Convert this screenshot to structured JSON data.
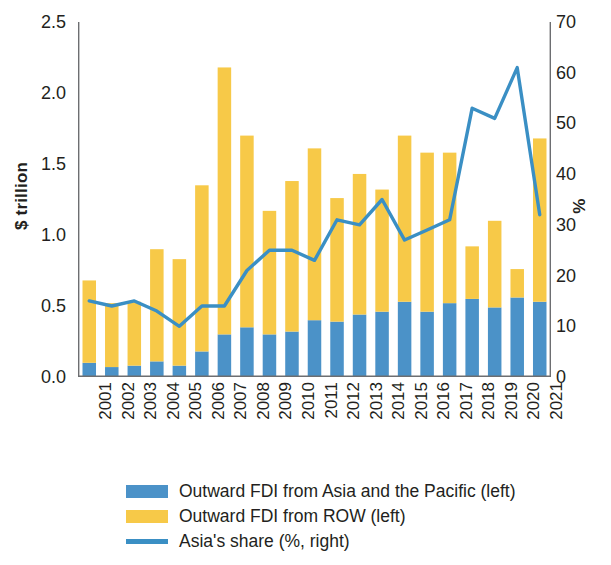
{
  "chart_data": {
    "type": "bar",
    "title": "",
    "subtitle": "",
    "xlabel": "",
    "ylabel": "$ trillion",
    "y2label": "%",
    "ylim": [
      0,
      2.5
    ],
    "y2lim": [
      0,
      70
    ],
    "yticks": [
      "0.0",
      "0.5",
      "1.0",
      "1.5",
      "2.0",
      "2.5"
    ],
    "ytick_values": [
      0.0,
      0.5,
      1.0,
      1.5,
      2.0,
      2.5
    ],
    "y2ticks": [
      "0",
      "10",
      "20",
      "30",
      "40",
      "50",
      "60",
      "70"
    ],
    "y2tick_values": [
      0,
      10,
      20,
      30,
      40,
      50,
      60,
      70
    ],
    "grid": false,
    "stacked": true,
    "legend_position": "bottom-left",
    "categories": [
      "2001",
      "2002",
      "2003",
      "2004",
      "2005",
      "2006",
      "2007",
      "2008",
      "2009",
      "2010",
      "2011",
      "2012",
      "2013",
      "2014",
      "2015",
      "2016",
      "2017",
      "2018",
      "2019",
      "2020",
      "2021"
    ],
    "series": [
      {
        "name": "Outward FDI from Asia and the Pacific (left)",
        "type": "bar",
        "axis": "left",
        "unit": "$ trillion",
        "color": "#4b92c8",
        "values": [
          0.1,
          0.07,
          0.08,
          0.11,
          0.08,
          0.18,
          0.3,
          0.35,
          0.3,
          0.32,
          0.4,
          0.39,
          0.44,
          0.46,
          0.53,
          0.46,
          0.52,
          0.55,
          0.49,
          0.56,
          0.53
        ]
      },
      {
        "name": "Outward FDI from ROW (left)",
        "type": "bar",
        "axis": "left",
        "unit": "$ trillion",
        "color": "#f7c948",
        "values": [
          0.58,
          0.45,
          0.45,
          0.79,
          0.75,
          1.17,
          1.88,
          1.35,
          0.87,
          1.06,
          1.21,
          0.87,
          0.99,
          0.86,
          1.17,
          1.12,
          1.06,
          0.37,
          0.61,
          0.2,
          1.15
        ]
      },
      {
        "name": "Asia's share (%, right)",
        "type": "line",
        "axis": "right",
        "unit": "%",
        "color": "#3a8fc4",
        "values": [
          15,
          14,
          15,
          13,
          10,
          14,
          14,
          21,
          25,
          25,
          23,
          31,
          30,
          35,
          27,
          29,
          31,
          53,
          51,
          61,
          32
        ]
      }
    ],
    "totals": [
      0.68,
      0.52,
      0.53,
      0.9,
      0.83,
      1.35,
      2.18,
      1.7,
      1.17,
      1.38,
      1.61,
      1.26,
      1.43,
      1.32,
      1.7,
      1.58,
      1.58,
      0.92,
      1.1,
      0.76,
      1.68
    ]
  },
  "axes": {
    "left_title": "$ trillion",
    "right_title": "%"
  },
  "legend": {
    "items": [
      {
        "label": "Outward FDI from Asia and the Pacific (left)",
        "color": "#4b92c8",
        "marker": "bar-swatch"
      },
      {
        "label": "Outward FDI from ROW (left)",
        "color": "#f7c948",
        "marker": "bar-swatch"
      },
      {
        "label": "Asia's share (%, right)",
        "color": "#3a8fc4",
        "marker": "line-swatch"
      }
    ]
  },
  "colors": {
    "asia_bar": "#4b92c8",
    "row_bar": "#f7c948",
    "share_line": "#3a8fc4",
    "axis": "#6d6e71",
    "text": "#231f20"
  }
}
